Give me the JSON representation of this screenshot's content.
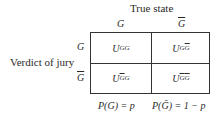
{
  "column_header": {
    "title": "True state",
    "columns": [
      "G",
      "Ḡ"
    ]
  },
  "row_header": {
    "title": "Verdict of jury",
    "rows": [
      "G",
      "Ḡ"
    ]
  },
  "cells": [
    [
      "U_GG",
      "U_GḠ"
    ],
    [
      "U_ḠG",
      "U_ḠḠ"
    ]
  ],
  "probabilities": {
    "p_guilty": "P(G) = p",
    "p_not_guilty": "P(Ḡ) = 1 − p"
  }
}
